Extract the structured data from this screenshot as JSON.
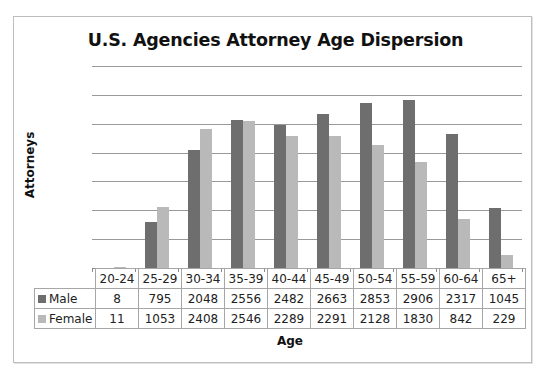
{
  "chart_data": {
    "type": "bar",
    "title": "U.S. Agencies Attorney Age Dispersion",
    "xlabel": "Age",
    "ylabel": "Attorneys",
    "categories": [
      "20-24",
      "25-29",
      "30-34",
      "35-39",
      "40-44",
      "45-49",
      "50-54",
      "55-59",
      "60-64",
      "65+"
    ],
    "series": [
      {
        "name": "Male",
        "color": "#6e6e6e",
        "values": [
          8,
          795,
          2048,
          2556,
          2482,
          2663,
          2853,
          2906,
          2317,
          1045
        ]
      },
      {
        "name": "Female",
        "color": "#b9b9b9",
        "values": [
          11,
          1053,
          2408,
          2546,
          2289,
          2291,
          2128,
          1830,
          842,
          229
        ]
      }
    ],
    "ylim": [
      0,
      3500
    ],
    "gridlines": [
      500,
      1000,
      1500,
      2000,
      2500,
      3000,
      3500
    ],
    "y_tick_labels_visible": false,
    "grid": true,
    "legend": "data table rows (left)",
    "data_table": true
  },
  "labels": {
    "title": "U.S. Agencies Attorney Age Dispersion",
    "xlabel": "Age",
    "ylabel": "Attorneys"
  }
}
